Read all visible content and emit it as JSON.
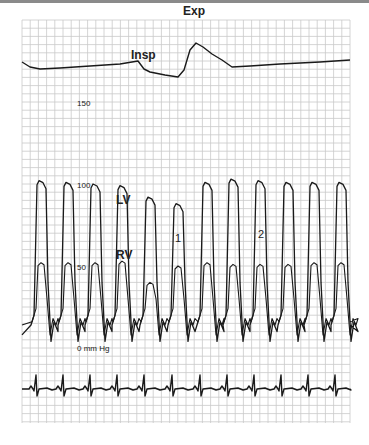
{
  "figure": {
    "top_bar_color": "#8a8a8a",
    "grid_color": "#c9c9c9",
    "trace_color": "#1a1a1a",
    "grid": {
      "x0": 22,
      "y0": 20,
      "x1": 350,
      "y1": 423,
      "step": 8.2
    }
  },
  "labels": {
    "insp": "Insp",
    "exp": "Exp",
    "lv": "LV",
    "rv": "RV",
    "beat1": "1",
    "beat2": "2",
    "scale_150": "150",
    "scale_100": "100",
    "scale_50": "50",
    "scale_0": "0 mm Hg"
  },
  "chart_data": {
    "type": "line",
    "title": "",
    "xlabel": "",
    "ylabel": "Pressure (mm Hg)",
    "y_scale_labels": [
      {
        "value": 150,
        "y_px": 103
      },
      {
        "value": 100,
        "y_px": 185
      },
      {
        "value": 50,
        "y_px": 267
      },
      {
        "value": 0,
        "y_px": 348
      }
    ],
    "ylim": [
      0,
      160
    ],
    "grid": true,
    "annotations": [
      "Insp",
      "Exp",
      "LV",
      "RV",
      "1",
      "2"
    ],
    "series": [
      {
        "name": "Respiration",
        "description": "Respiratory trace showing inspiration dip and expiration peak",
        "points": [
          [
            22,
            62
          ],
          [
            30,
            67
          ],
          [
            40,
            69
          ],
          [
            60,
            68
          ],
          [
            90,
            66
          ],
          [
            120,
            64
          ],
          [
            138,
            61
          ],
          [
            144,
            69
          ],
          [
            150,
            72
          ],
          [
            165,
            75
          ],
          [
            178,
            77
          ],
          [
            184,
            70
          ],
          [
            190,
            50
          ],
          [
            196,
            43
          ],
          [
            203,
            47
          ],
          [
            212,
            54
          ],
          [
            222,
            60
          ],
          [
            232,
            67
          ],
          [
            250,
            66
          ],
          [
            280,
            64
          ],
          [
            320,
            62
          ],
          [
            350,
            60
          ]
        ]
      },
      {
        "name": "LV",
        "description": "Left ventricular pressure, systolic ~102 mmHg, reduced on beat 1 (post-expiration)",
        "beats_x": [
          37,
          64,
          91,
          118,
          146,
          174,
          203,
          229,
          256,
          284,
          310,
          337
        ],
        "systolic_mmHg": [
          102,
          101,
          100,
          99,
          92,
          88,
          101,
          103,
          102,
          101,
          101,
          101
        ],
        "diastolic_min_mmHg": 4
      },
      {
        "name": "RV",
        "description": "Right ventricular pressure, systolic ~53 mmHg, increased on beat 1 relative to LV (discordance)",
        "beats_x": [
          37,
          64,
          91,
          118,
          146,
          174,
          203,
          229,
          256,
          284,
          310,
          337
        ],
        "systolic_mmHg": [
          52,
          52,
          52,
          53,
          40,
          50,
          52,
          51,
          51,
          51,
          52,
          52
        ],
        "diastolic_min_mmHg": 8
      },
      {
        "name": "ECG",
        "description": "ECG tracing with QRS spikes",
        "baseline_y_px": 389,
        "qrs_x": [
          35,
          62,
          89,
          116,
          143,
          171,
          199,
          226,
          253,
          280,
          307,
          334
        ]
      }
    ]
  }
}
